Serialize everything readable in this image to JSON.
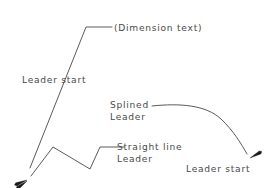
{
  "drawing": {
    "title": "leader-line-types",
    "background_color": "#ffffff",
    "line_color": "#3b3b3b",
    "arrow_color": "#1c1c1c",
    "text_color": "#4a4a4a"
  },
  "labels": {
    "dimension_text": "(Dimension text)",
    "leader_start_top": "Leader start",
    "splined_line1": "Splined",
    "splined_line2": "Leader",
    "straight_line1": "Straight line",
    "straight_line2": "Leader",
    "leader_start_bottom": "Leader start"
  },
  "geometry": {
    "straight_leader": {
      "name": "straight-leader-with-elbow",
      "points": "30,168 86,27 112,27",
      "arrow_tip": [
        27,
        180
      ],
      "arrow_angle_deg": 248
    },
    "splined_leader": {
      "name": "splined-leader",
      "path": "M152,106 C180,103 206,105 221,119 C233,130 242,145 247,154",
      "arrow_tip": [
        250,
        158
      ],
      "arrow_angle_deg": 61
    },
    "polyline_leader": {
      "name": "straight-line-polyline-leader",
      "points": "31,176 53,147 90,169 100,147 124,147",
      "arrow_tip": [
        27,
        181
      ],
      "arrow_angle_deg": 233
    }
  }
}
